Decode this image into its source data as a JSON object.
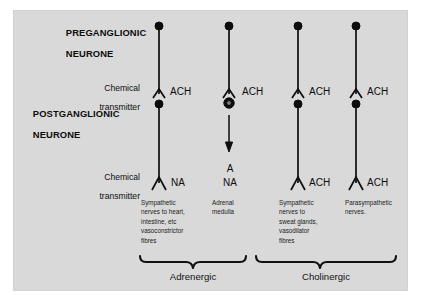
{
  "figure": {
    "background_color": "#d9d9d9",
    "ink_color": "#0d0d0d",
    "page_color": "#ffffff"
  },
  "row_labels": {
    "preganglionic_line1": "PREGANGLIONIC",
    "preganglionic_line2": "NEURONE",
    "chemical_transmitter_top_line1": "Chemical",
    "chemical_transmitter_top_line2": "transmitter",
    "postganglionic_line1": "POSTGANGLIONIC",
    "postganglionic_line2": "NEURONE",
    "chemical_transmitter_bottom_line1": "Chemical",
    "chemical_transmitter_bottom_line2": "transmitter"
  },
  "columns": [
    {
      "id": "sympathetic-adrenergic",
      "ganglion_transmitter": "ACH",
      "effector_transmitter": "NA",
      "effector_transmitter_extra": "",
      "caption": "Sympathetic\nnerves to heart,\nintestine, etc\nvasoconstrictor\nfibres",
      "has_postganglionic_dot": true,
      "has_effector_chevron": true,
      "has_arrow": false,
      "dot_style": "solid"
    },
    {
      "id": "adrenal-medulla",
      "ganglion_transmitter": "ACH",
      "effector_transmitter": "NA",
      "effector_transmitter_extra": "A",
      "caption": "Adrenal\nmedulla",
      "has_postganglionic_dot": true,
      "has_effector_chevron": false,
      "has_arrow": true,
      "dot_style": "ringed"
    },
    {
      "id": "sympathetic-cholinergic",
      "ganglion_transmitter": "ACH",
      "effector_transmitter": "ACH",
      "effector_transmitter_extra": "",
      "caption": "Sympathetic\nnerves to\nsweat glands,\nvasodilator\nfibres",
      "has_postganglionic_dot": true,
      "has_effector_chevron": true,
      "has_arrow": false,
      "dot_style": "solid"
    },
    {
      "id": "parasympathetic",
      "ganglion_transmitter": "ACH",
      "effector_transmitter": "ACH",
      "effector_transmitter_extra": "",
      "caption": "Parasympathetic\nnerves.",
      "has_postganglionic_dot": true,
      "has_effector_chevron": true,
      "has_arrow": false,
      "dot_style": "solid"
    }
  ],
  "groups": [
    {
      "id": "adrenergic",
      "label": "Adrenergic"
    },
    {
      "id": "cholinergic",
      "label": "Cholinergic"
    }
  ]
}
